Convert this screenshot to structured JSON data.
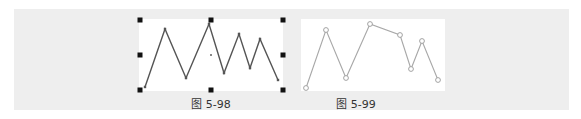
{
  "panel": {
    "background": "#eeeeee"
  },
  "figures": [
    {
      "caption": "图 5-98",
      "canvas": {
        "x": 139,
        "y": 19,
        "w": 144,
        "h": 72
      },
      "caption_pos": {
        "x": 211,
        "y": 95
      },
      "style": {
        "stroke": "#555555",
        "stroke_width": 1.4,
        "point_shape": "small-square",
        "point_color": "#555555"
      },
      "selected": true,
      "selection_handles": [
        [
          140,
          20
        ],
        [
          211,
          20
        ],
        [
          283,
          20
        ],
        [
          140,
          55
        ],
        [
          283,
          55
        ],
        [
          140,
          90
        ],
        [
          211,
          90
        ],
        [
          283,
          90
        ]
      ],
      "center_mark": [
        211,
        55
      ],
      "points": [
        [
          145,
          87
        ],
        [
          165,
          29
        ],
        [
          186,
          78
        ],
        [
          209,
          24
        ],
        [
          224,
          73
        ],
        [
          239,
          34
        ],
        [
          250,
          68
        ],
        [
          260,
          39
        ],
        [
          278,
          80
        ]
      ]
    },
    {
      "caption": "图 5-99",
      "canvas": {
        "x": 301,
        "y": 19,
        "w": 144,
        "h": 72
      },
      "caption_pos": {
        "x": 356,
        "y": 95
      },
      "style": {
        "stroke": "#a8a8a8",
        "stroke_width": 1.1,
        "point_shape": "hollow-circle",
        "point_color": "#999999"
      },
      "selected": false,
      "points": [
        [
          306,
          88
        ],
        [
          326,
          30
        ],
        [
          346,
          78
        ],
        [
          370,
          24
        ],
        [
          400,
          35
        ],
        [
          411,
          69
        ],
        [
          422,
          41
        ],
        [
          438,
          80
        ]
      ]
    }
  ]
}
